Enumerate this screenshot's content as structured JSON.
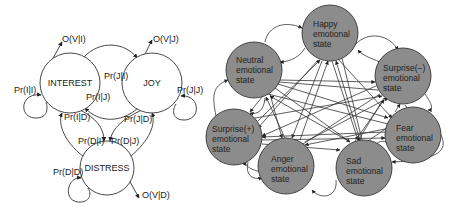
{
  "left_diagram": {
    "nodes": [
      {
        "id": "interest",
        "label": "INTEREST",
        "cx": 70,
        "cy": 83,
        "r": 30
      },
      {
        "id": "joy",
        "label": "JOY",
        "cx": 152,
        "cy": 83,
        "r": 30
      },
      {
        "id": "distress",
        "label": "DISTRESS",
        "cx": 107,
        "cy": 168,
        "r": 27
      }
    ],
    "labels": {
      "o_v_i": "O(V|I)",
      "o_v_j": "O(V|J)",
      "o_v_d": "O(V|D)",
      "pr_i_i": "Pr(I|I)",
      "pr_j_i": "Pr(J|I)",
      "pr_i_j": "Pr(I|J)",
      "pr_j_j": "Pr(J|J)",
      "pr_i_d": "Pr(I|D)",
      "pr_j_d": "Pr(J|D)",
      "pr_d_i": "Pr(D|I)",
      "pr_d_j": "Pr(D|J)",
      "pr_d_d": "Pr(D|D)"
    }
  },
  "right_diagram": {
    "node_fill": "#8c8c8c",
    "nodes": [
      {
        "id": "happy",
        "line1": "Happy",
        "line2": "emotional",
        "line3": "state",
        "cx": 330,
        "cy": 33
      },
      {
        "id": "neutral",
        "line1": "Neutral",
        "line2": "emotional",
        "line3": "state",
        "cx": 254,
        "cy": 69
      },
      {
        "id": "surprise_neg",
        "line1": "Surprise(−)",
        "line2": "emotional",
        "line3": "state",
        "cx": 403,
        "cy": 76
      },
      {
        "id": "surprise_pos",
        "line1": "Surprise(+)",
        "line2": "emotional",
        "line3": "state",
        "cx": 234,
        "cy": 137
      },
      {
        "id": "fear",
        "line1": "Fear",
        "line2": "emotional",
        "line3": "state",
        "cx": 413,
        "cy": 135
      },
      {
        "id": "anger",
        "line1": "Anger",
        "line2": "emotional",
        "line3": "state",
        "cx": 286,
        "cy": 166
      },
      {
        "id": "sad",
        "line1": "Sad",
        "line2": "emotional",
        "line3": "state",
        "cx": 364,
        "cy": 168
      }
    ]
  }
}
